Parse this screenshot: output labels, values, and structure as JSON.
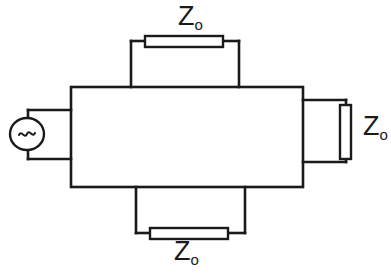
{
  "diagram": {
    "type": "electrical-circuit-schematic",
    "stroke_color": "#1a1a1a",
    "fill_color": "#ffffff",
    "background_color": "#ffffff",
    "labels": {
      "impedance_symbol": "Z",
      "impedance_subscript": "o",
      "top_load": "Z",
      "top_load_sub": "o",
      "right_load": "Z",
      "right_load_sub": "o",
      "bottom_load": "Z",
      "bottom_load_sub": "o"
    },
    "source": {
      "name": "ac-voltage-source",
      "symbol": "~"
    },
    "components": [
      {
        "name": "central-network-box",
        "kind": "box",
        "x": 71,
        "y": 87,
        "width": 232,
        "height": 100
      },
      {
        "name": "top-load-resistor",
        "kind": "resistor",
        "orientation": "horizontal",
        "x": 145,
        "y": 36,
        "width": 78,
        "height": 11
      },
      {
        "name": "right-load-resistor",
        "kind": "resistor",
        "orientation": "vertical",
        "x": 340,
        "y": 105,
        "width": 11,
        "height": 54
      },
      {
        "name": "bottom-load-resistor",
        "kind": "resistor",
        "orientation": "horizontal",
        "x": 150,
        "y": 228,
        "width": 78,
        "height": 11
      },
      {
        "name": "ac-source",
        "kind": "ellipse",
        "cx": 27,
        "cy": 134,
        "rx": 17,
        "ry": 16
      }
    ],
    "caption": ""
  }
}
